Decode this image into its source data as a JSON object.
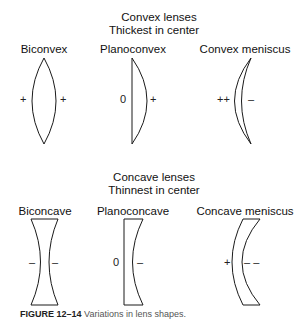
{
  "convex": {
    "title": "Convex lenses",
    "subtitle": "Thickest in center",
    "lenses": [
      {
        "name": "Biconvex",
        "left_sign": "+",
        "right_sign": "+"
      },
      {
        "name": "Planoconvex",
        "left_sign": "0",
        "right_sign": "+"
      },
      {
        "name": "Convex meniscus",
        "left_sign": "++",
        "right_sign": "–"
      }
    ]
  },
  "concave": {
    "title": "Concave lenses",
    "subtitle": "Thinnest in center",
    "lenses": [
      {
        "name": "Biconcave",
        "left_sign": "–",
        "right_sign": "–"
      },
      {
        "name": "Planoconcave",
        "left_sign": "0",
        "right_sign": "–"
      },
      {
        "name": "Concave meniscus",
        "left_sign": "+",
        "right_sign": "– –"
      }
    ]
  },
  "caption": {
    "label": "FIGURE 12–14",
    "text": "Variations in lens shapes."
  }
}
